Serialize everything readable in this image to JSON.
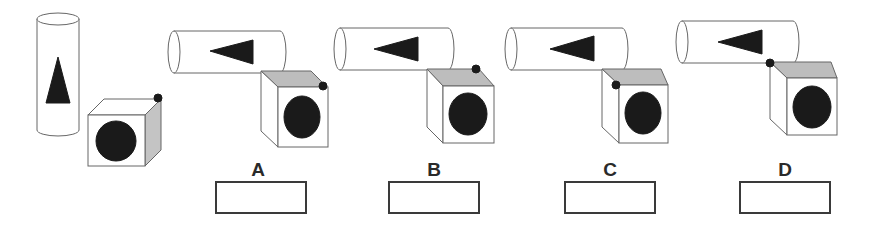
{
  "reference": {
    "cylinder": {
      "symbol": "triangle",
      "orientation": "vertical"
    },
    "cube": {
      "front_symbol": "circle",
      "dot_position": "top-right-back corner"
    }
  },
  "options": [
    {
      "label": "A",
      "dot_position": "front-top-right corner",
      "answer": ""
    },
    {
      "label": "B",
      "dot_position": "top face back-right",
      "answer": ""
    },
    {
      "label": "C",
      "dot_position": "front-top-left corner",
      "answer": ""
    },
    {
      "label": "D",
      "dot_position": "back-top-left corner",
      "answer": ""
    }
  ],
  "colors": {
    "stroke": "#555555",
    "fill_dark": "#1a1a1a",
    "top_face": "#bdbdbd",
    "side_face": "#c4c4c4"
  }
}
